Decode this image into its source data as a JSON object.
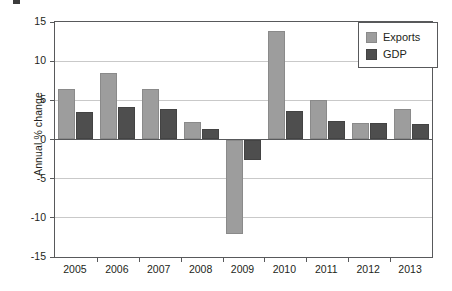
{
  "chart_data": {
    "type": "bar",
    "title": "",
    "subtitle": "",
    "xlabel": "",
    "ylabel": "Annual % change",
    "categories": [
      "2005",
      "2006",
      "2007",
      "2008",
      "2009",
      "2010",
      "2011",
      "2012",
      "2013"
    ],
    "series": [
      {
        "name": "Exports",
        "color": "#9d9d9d",
        "values": [
          6.4,
          8.5,
          6.4,
          2.2,
          -12.0,
          13.8,
          5.0,
          2.1,
          3.9
        ]
      },
      {
        "name": "GDP",
        "color": "#4e4e4e",
        "values": [
          3.5,
          4.1,
          3.9,
          1.3,
          -2.6,
          3.7,
          2.4,
          2.1,
          2.0
        ]
      }
    ],
    "ylim": [
      -15,
      15
    ],
    "yticks": [
      15,
      10,
      5,
      0,
      -5,
      -10,
      -15
    ],
    "ytick_labels": [
      "15",
      "10",
      "5",
      "0",
      "-5",
      "-10",
      "-15"
    ],
    "grid": true,
    "legend_position": "top-right"
  },
  "legend": {
    "items": [
      {
        "label": "Exports"
      },
      {
        "label": "GDP"
      }
    ]
  }
}
